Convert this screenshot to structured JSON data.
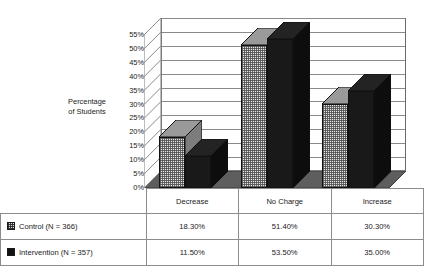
{
  "chart_data": {
    "type": "bar",
    "title": "",
    "xlabel": "",
    "ylabel": "Percentage of Students",
    "categories": [
      "Decrease",
      "No Charge",
      "Increase"
    ],
    "series": [
      {
        "name": "Control (N = 366)",
        "values": [
          18.3,
          51.4,
          30.3
        ],
        "labels": [
          "18.30%",
          "51.40%",
          "30.30%"
        ],
        "color": "#e6e6e6",
        "pattern": "fine-checker"
      },
      {
        "name": "Intervention (N = 357)",
        "values": [
          11.5,
          53.5,
          35.0
        ],
        "labels": [
          "11.50%",
          "53.50%",
          "35.00%"
        ],
        "color": "#191919",
        "pattern": "solid"
      }
    ],
    "ylim": [
      0,
      55
    ],
    "ytick_step": 5,
    "yticks": [
      "0%",
      "5%",
      "10%",
      "15%",
      "20%",
      "25%",
      "30%",
      "35%",
      "40%",
      "45%",
      "50%",
      "55%"
    ],
    "grid": true,
    "legend_position": "bottom-table",
    "style": "3d-column"
  },
  "axis": {
    "title_line1": "Percentage",
    "title_line2": "of Students"
  },
  "table": {
    "categories": [
      "Decrease",
      "No Charge",
      "Increase"
    ],
    "rows": [
      {
        "legend": "Control (N = 366)",
        "swatch": "control-swatch",
        "values": [
          "18.30%",
          "51.40%",
          "30.30%"
        ]
      },
      {
        "legend": "Intervention (N = 357)",
        "swatch": "intervention-swatch",
        "values": [
          "11.50%",
          "53.50%",
          "35.00%"
        ]
      }
    ]
  }
}
